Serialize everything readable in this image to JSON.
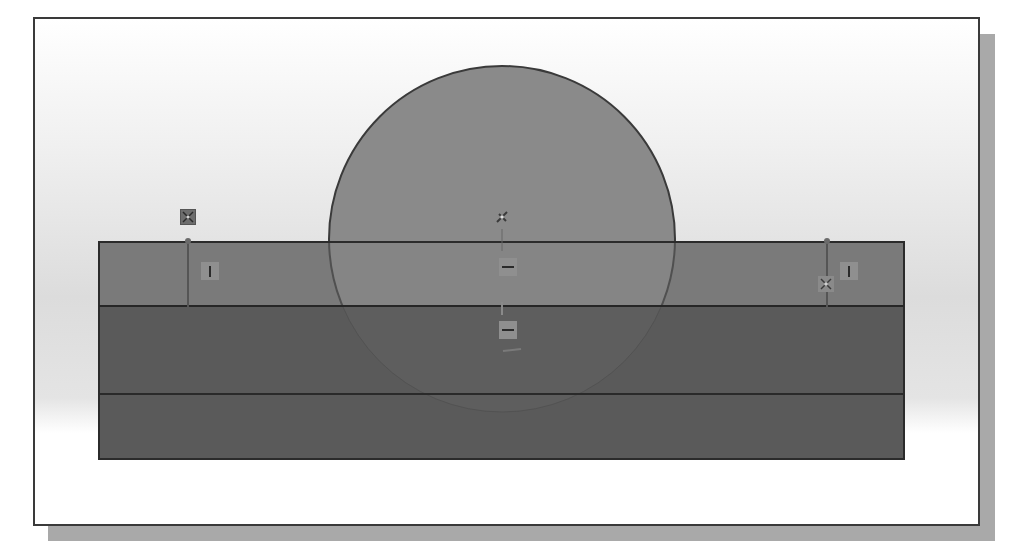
{
  "view": {
    "title": "",
    "background_gradient": [
      "#ffffff",
      "#dcdcdc"
    ],
    "frame_border_color": "#3a3a3a",
    "shadow_color": "#a9a9a9"
  },
  "sketch": {
    "rectangle": {
      "x": 64,
      "y": 223,
      "width": 805,
      "height": 217,
      "upper_band_fill": "#7a7a7a",
      "lower_band_fill": "#5a5a5a",
      "stroke": "#2b2b2b",
      "inner_lines_y": [
        287,
        375
      ]
    },
    "circle": {
      "cx": 467,
      "cy": 220,
      "r": 173,
      "fill": "#8a8a8a",
      "stroke": "#3a3a3a"
    }
  },
  "constraints": [
    {
      "type": "fix",
      "icon": "fix-icon",
      "x": 146,
      "y": 191
    },
    {
      "type": "point",
      "icon": "point-icon",
      "x": 459,
      "y": 191
    },
    {
      "type": "fix",
      "icon": "fix-icon",
      "x": 784,
      "y": 258
    },
    {
      "type": "vertical",
      "icon": "vertical-constraint-icon",
      "x": 167,
      "y": 244
    },
    {
      "type": "vertical",
      "icon": "vertical-constraint-icon",
      "x": 806,
      "y": 244
    },
    {
      "type": "horizontal",
      "icon": "horizontal-constraint-icon",
      "x": 465,
      "y": 240
    },
    {
      "type": "horizontal",
      "icon": "horizontal-constraint-icon",
      "x": 465,
      "y": 302
    }
  ],
  "colors": {
    "constraint_box": "#8f8f8f",
    "fix_box": "#6d6d6d",
    "glyph_stroke": "#2a2a2a"
  }
}
